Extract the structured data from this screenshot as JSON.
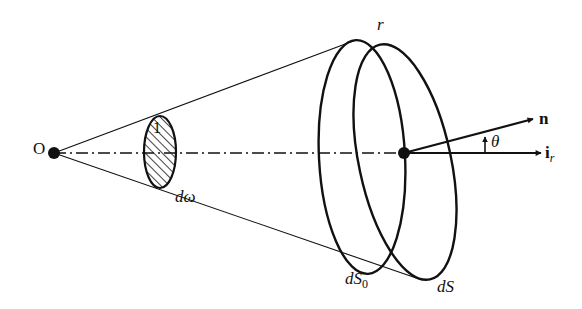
{
  "figure": {
    "labels": {
      "origin": "O",
      "unit_sphere": "1",
      "solid_angle": "dω",
      "radius": "r",
      "projected_area_base": "dS",
      "projected_area_sub": "0",
      "area": "dS",
      "normal": "n",
      "radial_unit_bold": "i",
      "radial_unit_sub": "r",
      "angle": "θ"
    },
    "colors": {
      "ink": "#111111",
      "background": "#ffffff"
    }
  }
}
